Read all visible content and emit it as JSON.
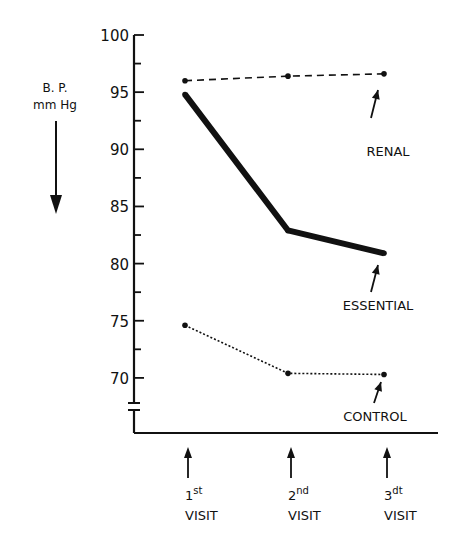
{
  "chart_data": {
    "type": "line",
    "title": "",
    "xlabel": "",
    "ylabel": "B.P. mmHg",
    "ylabel_lines": [
      "B. P.",
      "mm Hg"
    ],
    "ylim": [
      67,
      100
    ],
    "yticks": [
      100,
      95,
      90,
      85,
      80,
      75,
      70
    ],
    "axis_break": true,
    "grid": false,
    "categories": [
      {
        "ordinal": "1",
        "suffix": "st",
        "label": "VISIT"
      },
      {
        "ordinal": "2",
        "suffix": "nd",
        "label": "VISIT"
      },
      {
        "ordinal": "3",
        "suffix": "dt",
        "label": "VISIT"
      }
    ],
    "series": [
      {
        "name": "RENAL",
        "style": "dashed",
        "values": [
          96.0,
          96.4,
          96.6
        ]
      },
      {
        "name": "ESSENTIAL",
        "style": "thick-solid",
        "values": [
          94.8,
          82.9,
          80.9
        ]
      },
      {
        "name": "CONTROL",
        "style": "dotted",
        "values": [
          74.6,
          70.4,
          70.3
        ]
      }
    ],
    "legend_position": "inline-annotations"
  }
}
